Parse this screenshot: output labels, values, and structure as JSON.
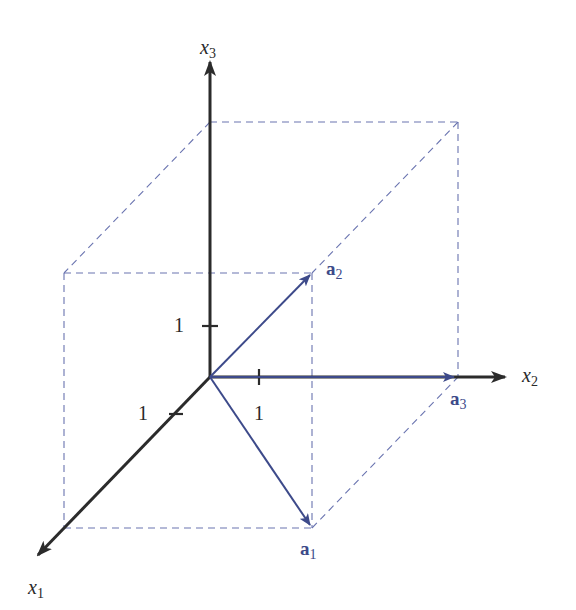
{
  "diagram": {
    "type": "3d-vector-parallelepiped",
    "colors": {
      "axis": "#2b2b2b",
      "vector": "#3d4a8a",
      "dashed": "#6a74b0",
      "label_axis": "#2a2a2a",
      "label_vector": "#3d4a8a"
    },
    "axes": [
      {
        "id": "x1",
        "base": "x",
        "sub": "1"
      },
      {
        "id": "x2",
        "base": "x",
        "sub": "2"
      },
      {
        "id": "x3",
        "base": "x",
        "sub": "3"
      }
    ],
    "ticks": [
      {
        "axis": "x3",
        "label": "1"
      },
      {
        "axis": "x1",
        "label": "1"
      },
      {
        "axis": "x2",
        "label": "1"
      }
    ],
    "vectors": [
      {
        "id": "a1",
        "base": "a",
        "sub": "1"
      },
      {
        "id": "a2",
        "base": "a",
        "sub": "2"
      },
      {
        "id": "a3",
        "base": "a",
        "sub": "3"
      }
    ]
  }
}
